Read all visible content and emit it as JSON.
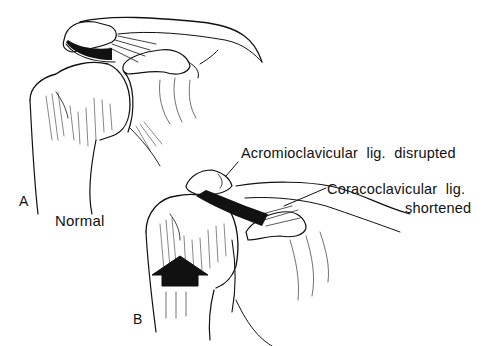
{
  "figure": {
    "panel_a": {
      "letter": "A",
      "caption": "Normal"
    },
    "panel_b": {
      "letter": "B",
      "labels": {
        "acromioclavicular": "Acromioclavicular  lig.  disrupted",
        "coracoclavicular_line1": "Coracoclavicular  lig.",
        "coracoclavicular_line2": "shortened"
      },
      "arrow": "upward-force-arrow"
    },
    "colors": {
      "ink": "#111111",
      "background": "#ffffff"
    }
  }
}
